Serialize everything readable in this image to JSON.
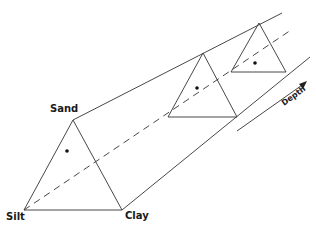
{
  "diagram": {
    "title": "",
    "labels": {
      "sand": "Sand",
      "silt": "Silt",
      "clay": "Clay",
      "depth": "Depth"
    },
    "vertices": {
      "sand": [
        73,
        120
      ],
      "silt": [
        24,
        210
      ],
      "clay": [
        122,
        210
      ]
    },
    "triangles": [
      {
        "name": "front",
        "apex": [
          73,
          120
        ],
        "left": [
          24,
          210
        ],
        "right": [
          122,
          210
        ],
        "dot": [
          67,
          151
        ]
      },
      {
        "name": "middle",
        "apex": [
          203,
          53
        ],
        "left": [
          168,
          117
        ],
        "right": [
          237,
          117
        ],
        "dot": [
          197,
          88
        ]
      },
      {
        "name": "back",
        "apex": [
          259,
          23
        ],
        "left": [
          231,
          72
        ],
        "right": [
          286,
          72
        ],
        "dot": [
          255,
          63
        ]
      }
    ],
    "colors": {
      "line": "#333333",
      "dot": "#111111",
      "background": "#ffffff"
    }
  }
}
